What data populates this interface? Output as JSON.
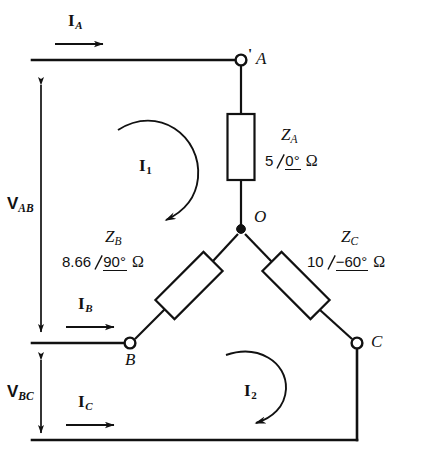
{
  "diagram": {
    "stroke_color": "#111111",
    "background": "#ffffff",
    "nodes": [
      {
        "id": "A",
        "label": "A",
        "marker": "open-circle",
        "x": 241,
        "y": 60
      },
      {
        "id": "O",
        "label": "O",
        "marker": "filled-dot",
        "x": 241,
        "y": 228
      },
      {
        "id": "B",
        "label": "B",
        "marker": "open-circle",
        "x": 130,
        "y": 343
      },
      {
        "id": "C",
        "label": "C",
        "marker": "open-circle",
        "x": 357,
        "y": 343
      }
    ],
    "impedances": [
      {
        "id": "ZA",
        "name": "Z",
        "name_sub": "A",
        "magnitude": "5",
        "angle": "0°",
        "unit": "Ω",
        "branch": "A-O",
        "orientation": "vertical"
      },
      {
        "id": "ZB",
        "name": "Z",
        "name_sub": "B",
        "magnitude": "8.66",
        "angle": "90°",
        "unit": "Ω",
        "branch": "B-O",
        "orientation": "diagonal-up-right"
      },
      {
        "id": "ZC",
        "name": "Z",
        "name_sub": "C",
        "magnitude": "10",
        "angle": "−60°",
        "unit": "Ω",
        "branch": "O-C",
        "orientation": "diagonal-down-right"
      }
    ],
    "line_currents": [
      {
        "id": "IA",
        "symbol": "I",
        "sub": "A",
        "direction": "right"
      },
      {
        "id": "IB",
        "symbol": "I",
        "sub": "B",
        "direction": "right"
      },
      {
        "id": "IC",
        "symbol": "I",
        "sub": "C",
        "direction": "right"
      }
    ],
    "mesh_currents": [
      {
        "id": "I1",
        "symbol": "I",
        "sub": "1",
        "direction": "clockwise"
      },
      {
        "id": "I2",
        "symbol": "I",
        "sub": "2",
        "direction": "clockwise"
      }
    ],
    "voltages": [
      {
        "id": "VAB",
        "symbol": "V",
        "sub": "AB",
        "arrow": "double-headed-vertical"
      },
      {
        "id": "VBC",
        "symbol": "V",
        "sub": "BC",
        "arrow": "double-headed-vertical"
      }
    ],
    "terminal_tick": "'"
  }
}
